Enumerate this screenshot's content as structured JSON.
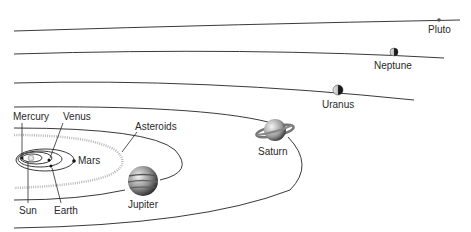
{
  "diagram": {
    "colors": {
      "orbit": "#3a3a3a",
      "label": "#2a2a2a",
      "asteroid": "#b8b8b8",
      "background": "#ffffff"
    },
    "bodies": [
      {
        "name": "Sun",
        "label": "Sun"
      },
      {
        "name": "Mercury",
        "label": "Mercury"
      },
      {
        "name": "Venus",
        "label": "Venus"
      },
      {
        "name": "Earth",
        "label": "Earth"
      },
      {
        "name": "Mars",
        "label": "Mars"
      },
      {
        "name": "Asteroids",
        "label": "Asteroids"
      },
      {
        "name": "Jupiter",
        "label": "Jupiter"
      },
      {
        "name": "Saturn",
        "label": "Saturn"
      },
      {
        "name": "Uranus",
        "label": "Uranus"
      },
      {
        "name": "Neptune",
        "label": "Neptune"
      },
      {
        "name": "Pluto",
        "label": "Pluto"
      }
    ]
  }
}
